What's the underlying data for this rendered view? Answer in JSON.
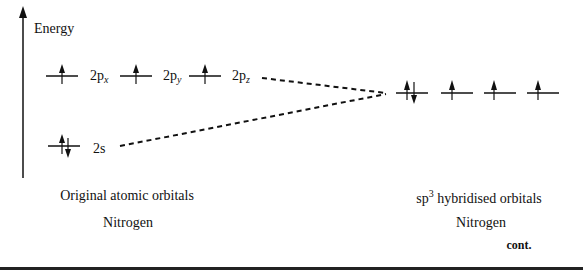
{
  "axis": {
    "label": "Energy"
  },
  "left": {
    "p_orbitals": [
      {
        "label_main": "2p",
        "label_sub": "x",
        "electrons": "up"
      },
      {
        "label_main": "2p",
        "label_sub": "y",
        "electrons": "up"
      },
      {
        "label_main": "2p",
        "label_sub": "z",
        "electrons": "up"
      }
    ],
    "s_orbital": {
      "label": "2s",
      "electrons": "up-down"
    },
    "caption": "Original atomic orbitals",
    "element": "Nitrogen"
  },
  "right": {
    "hybrid_orbitals": [
      {
        "electrons": "up-down"
      },
      {
        "electrons": "up"
      },
      {
        "electrons": "up"
      },
      {
        "electrons": "up"
      }
    ],
    "caption_prefix": "sp",
    "caption_sup": "3",
    "caption_suffix": " hybridised orbitals",
    "element": "Nitrogen"
  },
  "footer": {
    "continued": "cont."
  }
}
